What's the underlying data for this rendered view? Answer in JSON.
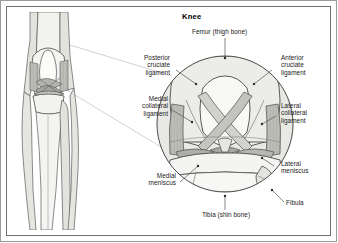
{
  "figure": {
    "title": "Knee",
    "panels": {
      "left": "leg-anterior-view",
      "right": "knee-joint-magnified-circle"
    }
  },
  "labels": {
    "femur": "Femur (thigh bone)",
    "posterior_cruciate": "Posterior\ncruciate\nligament",
    "anterior_cruciate": "Anterior\ncruciate\nligament",
    "medial_collateral": "Medial\ncollateral\nligament",
    "lateral_collateral": "Lateral\ncollateral\nligament",
    "medial_meniscus": "Medial\nmeniscus",
    "lateral_meniscus": "Lateral\nmeniscus",
    "tibia": "Tibia (shin bone)",
    "fibula": "Fibula"
  },
  "colors": {
    "bone_fill": "#efefec",
    "bone_shade": "#d6d6d1",
    "bone_light": "#f7f7f5",
    "outline": "#4a4a4a",
    "ligament_fill": "#b9b9b4",
    "ligament_dark": "#8d8d88",
    "meniscus": "#a9a9a4",
    "frame_outer": "#9a9a9a",
    "frame_inner": "#6f6f6f",
    "text": "#1a1a1a",
    "leader": "#555555",
    "magnifier_line": "#b0b0b0"
  }
}
